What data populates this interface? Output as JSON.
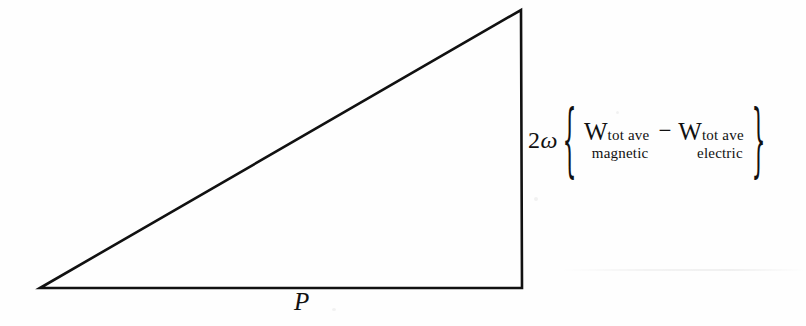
{
  "figure": {
    "type": "right-triangle-power-diagram",
    "background_color": "#fefefe",
    "stroke_color": "#111111"
  },
  "labels": {
    "horizontal_leg": "P",
    "vertical_leg": {
      "coefficient_number": "2",
      "coefficient_symbol": "ω",
      "open_brace": "{",
      "close_brace": "}",
      "operator": "−",
      "term1": {
        "symbol": "W",
        "subscript_line1": "tot ave",
        "subscript_line2": "magnetic"
      },
      "term2": {
        "symbol": "W",
        "subscript_line1": "tot ave",
        "subscript_line2": "electric"
      }
    }
  },
  "geometry": {
    "apex": [
      521,
      10
    ],
    "bottom_left": [
      40,
      288
    ],
    "bottom_right": [
      522,
      288
    ],
    "stroke_width": 2.6
  }
}
